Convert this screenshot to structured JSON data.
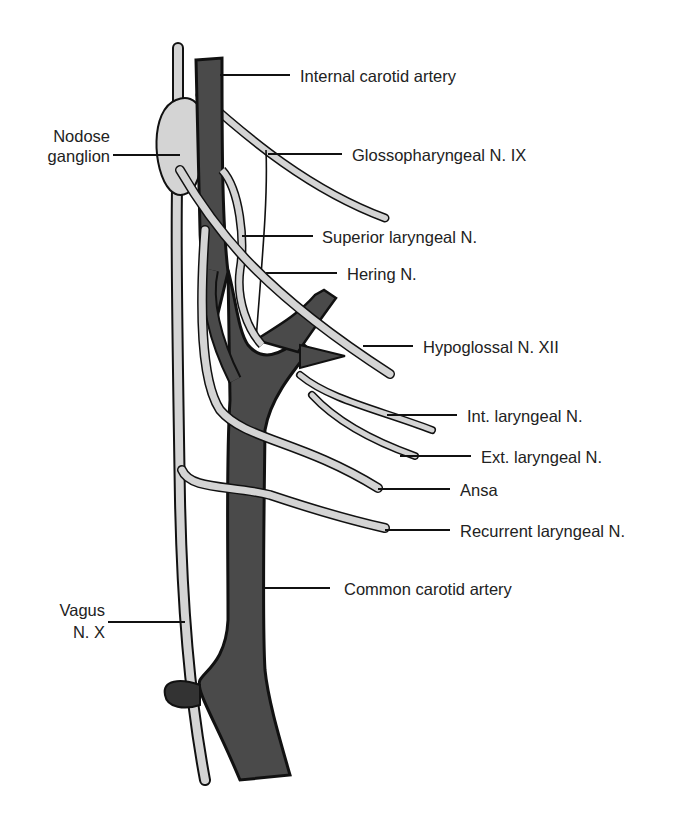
{
  "diagram": {
    "colors": {
      "artery_fill": "#4a4a4a",
      "artery_dark": "#1a1a1a",
      "nerve_fill": "#d4d4d4",
      "outline": "#111111",
      "background": "#ffffff",
      "text": "#222222"
    },
    "labels": {
      "internal_carotid": "Internal carotid artery",
      "nodose_line1": "Nodose",
      "nodose_line2": "ganglion",
      "glossopharyngeal": "Glossopharyngeal N. IX",
      "superior_laryngeal": "Superior laryngeal N.",
      "hering": "Hering N.",
      "hypoglossal": "Hypoglossal N. XII",
      "int_laryngeal": "Int. laryngeal N.",
      "ext_laryngeal": "Ext. laryngeal N.",
      "ansa": "Ansa",
      "recurrent_laryngeal": "Recurrent laryngeal N.",
      "common_carotid": "Common carotid artery",
      "vagus_line1": "Vagus",
      "vagus_line2": "N. X"
    }
  }
}
